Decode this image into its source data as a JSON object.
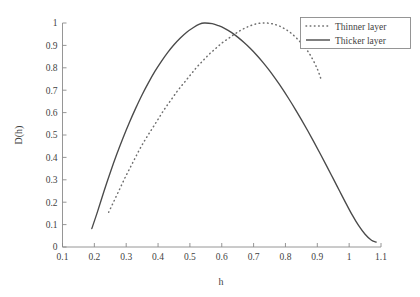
{
  "chart_data": {
    "type": "line",
    "title": "",
    "subtitle": "",
    "xlabel": "h",
    "ylabel": "D(h)",
    "xlim": [
      0.1,
      1.1
    ],
    "ylim": [
      0,
      1
    ],
    "grid": false,
    "legend_position": "top-right",
    "x_ticks": [
      "0.1",
      "0.2",
      "0.3",
      "0.4",
      "0.5",
      "0.6",
      "0.7",
      "0.8",
      "0.9",
      "1",
      "1.1"
    ],
    "x_tick_values": [
      0.1,
      0.2,
      0.3,
      0.4,
      0.5,
      0.6,
      0.7,
      0.8,
      0.9,
      1.0,
      1.1
    ],
    "y_ticks": [
      "0",
      "0.1",
      "0.2",
      "0.3",
      "0.4",
      "0.5",
      "0.6",
      "0.7",
      "0.8",
      "0.9",
      "1"
    ],
    "y_tick_values": [
      0,
      0.1,
      0.2,
      0.3,
      0.4,
      0.5,
      0.6,
      0.7,
      0.8,
      0.9,
      1.0
    ],
    "series": [
      {
        "name": "Thinner layer",
        "style": "dotted",
        "color": "#6e6e6e",
        "peak_x": 0.7,
        "peak_y": 1.0,
        "x": [
          0.245,
          0.26,
          0.28,
          0.3,
          0.32,
          0.34,
          0.36,
          0.38,
          0.4,
          0.42,
          0.44,
          0.46,
          0.48,
          0.5,
          0.52,
          0.54,
          0.56,
          0.58,
          0.6,
          0.62,
          0.64,
          0.66,
          0.68,
          0.7,
          0.72,
          0.74,
          0.76,
          0.78,
          0.8,
          0.82,
          0.84,
          0.86,
          0.88,
          0.9,
          0.912
        ],
        "values": [
          0.155,
          0.2,
          0.26,
          0.32,
          0.375,
          0.43,
          0.48,
          0.525,
          0.57,
          0.615,
          0.655,
          0.695,
          0.73,
          0.765,
          0.8,
          0.83,
          0.86,
          0.885,
          0.91,
          0.93,
          0.95,
          0.968,
          0.982,
          0.993,
          0.999,
          1.0,
          0.996,
          0.987,
          0.972,
          0.952,
          0.925,
          0.893,
          0.852,
          0.795,
          0.748
        ]
      },
      {
        "name": "Thicker layer",
        "style": "solid",
        "color": "#4a4a4a",
        "peak_x": 0.545,
        "peak_y": 1.0,
        "x": [
          0.192,
          0.21,
          0.23,
          0.25,
          0.27,
          0.29,
          0.31,
          0.33,
          0.35,
          0.37,
          0.39,
          0.41,
          0.43,
          0.45,
          0.47,
          0.49,
          0.51,
          0.53,
          0.545,
          0.57,
          0.59,
          0.61,
          0.63,
          0.65,
          0.67,
          0.69,
          0.71,
          0.73,
          0.75,
          0.77,
          0.79,
          0.81,
          0.83,
          0.85,
          0.87,
          0.89,
          0.91,
          0.93,
          0.95,
          0.97,
          0.99,
          1.01,
          1.03,
          1.05,
          1.07,
          1.085
        ],
        "values": [
          0.082,
          0.158,
          0.248,
          0.333,
          0.413,
          0.487,
          0.556,
          0.62,
          0.68,
          0.734,
          0.784,
          0.828,
          0.868,
          0.903,
          0.933,
          0.959,
          0.979,
          0.995,
          1.0,
          0.997,
          0.988,
          0.975,
          0.958,
          0.937,
          0.913,
          0.886,
          0.856,
          0.823,
          0.787,
          0.748,
          0.707,
          0.663,
          0.617,
          0.569,
          0.519,
          0.467,
          0.414,
          0.36,
          0.305,
          0.25,
          0.195,
          0.142,
          0.095,
          0.057,
          0.03,
          0.022
        ]
      }
    ]
  },
  "legend": {
    "entries": [
      {
        "label": "Thinner layer",
        "style": "dotted"
      },
      {
        "label": "Thicker layer",
        "style": "solid"
      }
    ]
  },
  "colors": {
    "axis": "#8a8a8a",
    "text": "#3f3f3f",
    "background": "#ffffff",
    "solid_series": "#4a4a4a",
    "dotted_series": "#6e6e6e"
  }
}
